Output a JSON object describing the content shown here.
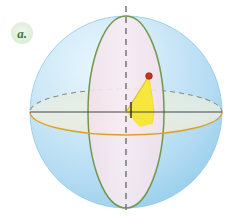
{
  "figure": {
    "kind": "geometry-diagram",
    "canvas": {
      "width": 226,
      "height": 220,
      "background": "#ffffff"
    }
  },
  "part_label": {
    "text": "a.",
    "badge_fill": "#e3efe0",
    "text_color": "#3f7a3a",
    "center_x": 22,
    "center_y": 33,
    "radius": 11
  },
  "sphere": {
    "name": "sphere-body",
    "center_x": 126,
    "center_y": 112,
    "radius": 96,
    "fill_light": "#dcf0fb",
    "fill_mid": "#bfe2f5",
    "fill_edge": "#9ed2ee",
    "outline": "#8ec9e8"
  },
  "meridian_disc": {
    "name": "meridian-great-circle-disc",
    "center_x": 126,
    "center_y": 112,
    "semi_width": 38,
    "semi_height": 96,
    "fill": "#f6e6ef",
    "stroke": "#6f9a4e",
    "stroke_width": 1.4
  },
  "equator_disc": {
    "name": "equatorial-great-circle-disc",
    "center_x": 126,
    "center_y": 112,
    "semi_width": 96,
    "semi_height": 23,
    "fill": "#e6ecdf",
    "stroke_front": "#d9a12a",
    "stroke_back": "#9a9a8a",
    "stroke_width": 1.2
  },
  "polar_axis": {
    "name": "polar-axis-dashed",
    "x": 126,
    "y_top": 6,
    "y_bottom": 214,
    "color": "#7d7d7d",
    "dash": "6 5",
    "width": 1.6
  },
  "horizontal_axis": {
    "name": "horizontal-axis-line",
    "x_left": 30,
    "x_right": 222,
    "y": 112,
    "color": "#44474a",
    "width": 1.2
  },
  "angle_wedge": {
    "name": "yellow-angle-sector",
    "fill": "#f7e63c",
    "stroke": "#e0cf22",
    "apex_x": 126,
    "apex_y": 112,
    "point_x": 149,
    "point_y": 76,
    "arc_end_x": 152,
    "arc_end_y": 124
  },
  "angle_tick": {
    "name": "angle-tick-mark",
    "x": 131,
    "y_top": 102,
    "y_bottom": 118,
    "color": "#23241f",
    "width": 1.3
  },
  "marked_point": {
    "name": "marked-point-on-sphere",
    "x": 149,
    "y": 76,
    "radius": 3.2,
    "fill": "#c8351c",
    "stroke": "#8e2412"
  }
}
